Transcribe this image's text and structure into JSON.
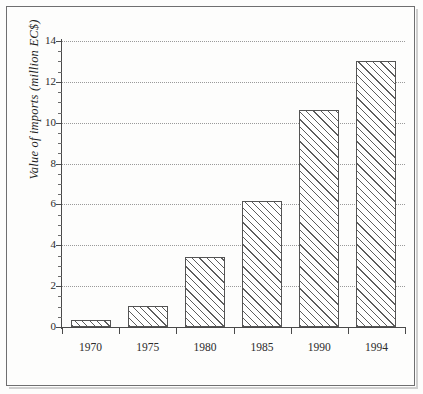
{
  "figure": {
    "background_color": "#fdfdfc",
    "frame_color": "#6f6f70",
    "bar_edge_color": "#545454",
    "hatch_color": "#5d5d5d",
    "grid_color": "#9a9a9a",
    "axis_color": "#4a4a4a",
    "text_color": "#2b2b2b"
  },
  "chart_data": {
    "type": "bar",
    "title": "",
    "xlabel": "",
    "ylabel": "Value of imports (million EC$)",
    "categories": [
      "1970",
      "1975",
      "1980",
      "1985",
      "1990",
      "1994"
    ],
    "values": [
      0.35,
      1.05,
      3.45,
      6.15,
      10.6,
      13.0
    ],
    "ylim": [
      0,
      14
    ],
    "yticks": [
      0,
      2,
      4,
      6,
      8,
      10,
      12,
      14
    ],
    "ytick_labels": [
      "0",
      "2",
      "4",
      "6",
      "8",
      "10",
      "12",
      "14"
    ],
    "yminor_ticks": [
      0.5,
      1,
      1.5,
      2.5,
      3,
      3.5,
      4.5,
      5,
      5.5,
      6.5,
      7,
      7.5,
      8.5,
      9,
      9.5,
      10.5,
      11,
      11.5,
      12.5,
      13,
      13.5
    ],
    "grid": "horizontal-dotted",
    "legend": "none",
    "bar_fill": "diagonal-hatch",
    "series": [
      {
        "name": "Value of imports",
        "values": [
          0.35,
          1.05,
          3.45,
          6.15,
          10.6,
          13.0
        ]
      }
    ]
  }
}
